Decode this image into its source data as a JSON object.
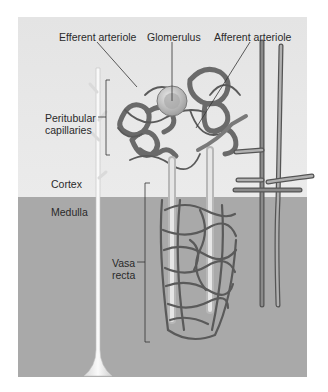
{
  "diagram": {
    "colors": {
      "cortex_bg": "#e6e6e6",
      "medulla_bg": "#a9a9a9",
      "vessel": "#8a8a8a",
      "vessel_outline": "#4a4a4a",
      "glomerulus": "#b8b8b8",
      "leader_line": "#333333",
      "tubule": "#f2f2f2"
    },
    "labels": {
      "efferent_arteriole": "Efferent arteriole",
      "glomerulus": "Glomerulus",
      "afferent_arteriole": "Afferent arteriole",
      "peritubular_line1": "Peritubular",
      "peritubular_line2": "capillaries",
      "cortex": "Cortex",
      "medulla": "Medulla",
      "vasa_line1": "Vasa",
      "vasa_line2": "recta"
    },
    "regions": [
      {
        "name": "Cortex",
        "position": "upper"
      },
      {
        "name": "Medulla",
        "position": "lower"
      }
    ]
  }
}
